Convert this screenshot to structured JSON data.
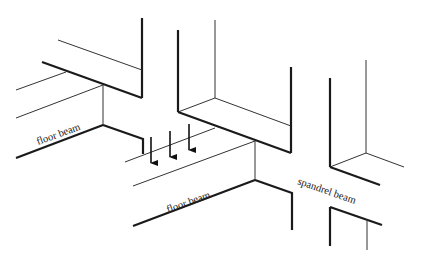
{
  "diagram": {
    "labels": {
      "left_floor_beam": "floor beam",
      "center_floor_beam": "floor beam",
      "spandrel_beam": "spandrel beam"
    },
    "arrows": {
      "count": 3,
      "direction": "down",
      "meaning": "load"
    },
    "colors": {
      "line": "#1a1a1a",
      "background": "#ffffff"
    }
  }
}
